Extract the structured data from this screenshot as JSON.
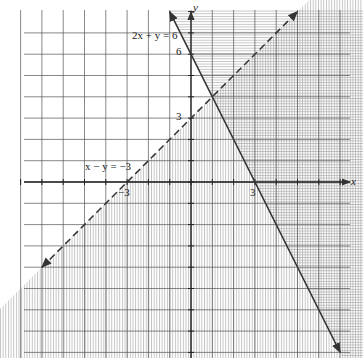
{
  "chart_data": {
    "type": "line",
    "title": "",
    "xlabel": "x",
    "ylabel": "y",
    "xlim": [
      -8.5,
      7.5
    ],
    "ylim": [
      -8.2,
      8.2
    ],
    "grid": true,
    "legend": "none",
    "tick_labels": {
      "x": [
        {
          "value": -3,
          "label": "−3"
        },
        {
          "value": 3,
          "label": "3"
        }
      ],
      "y": [
        {
          "value": 3,
          "label": "3"
        },
        {
          "value": 6,
          "label": "6"
        }
      ]
    },
    "series": [
      {
        "name": "2x + y = 6",
        "style": "solid",
        "equation": "y = 6 - 2x",
        "points": [
          [
            -1,
            8
          ],
          [
            7,
            -8
          ]
        ],
        "intercepts": {
          "x": 3,
          "y": 6
        },
        "arrows": "both"
      },
      {
        "name": "x − y = −3",
        "style": "dashed",
        "equation": "y = x + 3",
        "points": [
          [
            -7,
            -4
          ],
          [
            5,
            8
          ]
        ],
        "intercepts": {
          "x": -3,
          "y": 3
        },
        "arrows": "both"
      }
    ],
    "shaded_regions": [
      {
        "description": "vertical hatching below dashed line",
        "inequality": "x - y >= -3"
      },
      {
        "description": "horizontal hatching right of solid line",
        "inequality": "2x + y >= 6"
      }
    ],
    "intersection": [
      1,
      4
    ],
    "annotations": [
      {
        "text": "2x + y = 6",
        "x": -2.6,
        "y": 7
      },
      {
        "text": "x − y = −3",
        "x": -4.9,
        "y": 0.7
      }
    ]
  },
  "labels": {
    "eq1": "2x + y = 6",
    "eq2": "x − y = −3",
    "y6": "6",
    "y3": "3",
    "xneg3": "−3",
    "x3": "3",
    "xaxis": "x",
    "yaxis": "y"
  }
}
